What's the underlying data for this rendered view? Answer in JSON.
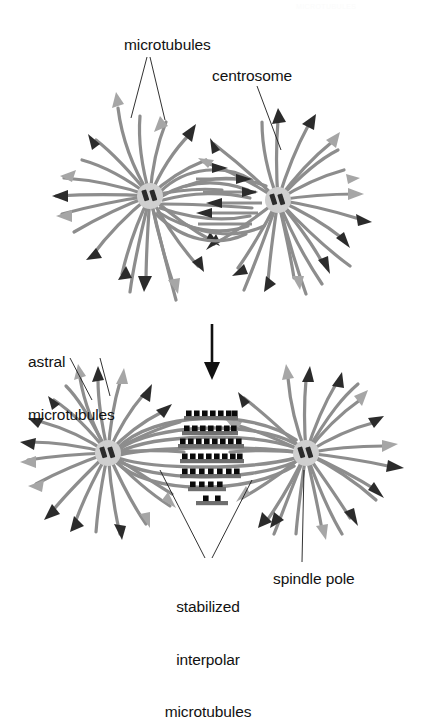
{
  "figure": {
    "title_fragment": "MICROTUBULES",
    "labels": {
      "microtubules": "microtubules",
      "centrosome": "centrosome",
      "astral": "astral\nmicrotubules",
      "astral_line1": "astral",
      "astral_line2": "microtubules",
      "stabilized": "stabilized\ninterpolar\nmicrotubules",
      "stabilized_line1": "stabilized",
      "stabilized_line2": "interpolar",
      "stabilized_line3": "microtubules",
      "spindle_pole": "spindle pole"
    },
    "colors": {
      "microtubule": "#8d8d8d",
      "microtubule_dark": "#7a7a7a",
      "arrow_dark": "#2b2b2b",
      "arrow_light": "#a6a6a6",
      "centrosome_fill": "#cfcfcf",
      "centriole": "#2b2b2b",
      "motor_protein": "#0a0a0a",
      "leader_line": "#1a1a1a",
      "text": "#121212",
      "background": "#ffffff"
    },
    "panels": [
      {
        "name": "top-panel",
        "stage": "separating asters",
        "centrosomes": [
          {
            "name": "centrosome-left",
            "cx": 150,
            "cy": 196,
            "r": 13
          },
          {
            "name": "centrosome-right",
            "cx": 278,
            "cy": 200,
            "r": 13
          }
        ],
        "astral_count_left": 20,
        "astral_count_right": 20,
        "interpolar_count": 9
      },
      {
        "name": "bottom-panel",
        "stage": "bipolar spindle",
        "spindle_poles": [
          {
            "name": "spindle-pole-left",
            "cx": 108,
            "cy": 453,
            "r": 13
          },
          {
            "name": "spindle-pole-right",
            "cx": 306,
            "cy": 453,
            "r": 13
          }
        ],
        "astral_count_left": 20,
        "astral_count_right": 20,
        "interpolar_rows": 7,
        "motor_dots_per_row": [
          7,
          7,
          8,
          8,
          7,
          4,
          2
        ]
      }
    ],
    "transition_arrow": {
      "name": "transition-arrow",
      "direction": "down",
      "x": 212,
      "y_top": 325,
      "y_bottom": 379
    }
  }
}
